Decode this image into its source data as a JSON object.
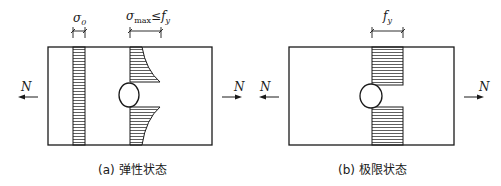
{
  "panels": [
    {
      "id": "a",
      "caption": "(a) 弹性状态",
      "stress_labels": {
        "sigma0": "σ",
        "sigma0_sub": "0",
        "sigmamax": "σ",
        "sigmamax_sub": "max",
        "leq": "≤",
        "fy": "f",
        "fy_sub": "y"
      },
      "force_left": "N",
      "force_right": "N"
    },
    {
      "id": "b",
      "caption": "(b) 极限状态",
      "stress_labels": {
        "fy": "f",
        "fy_sub": "y"
      },
      "force_left": "N",
      "force_right": "N"
    }
  ],
  "colors": {
    "line": "#1a1a1a",
    "background": "#ffffff"
  }
}
